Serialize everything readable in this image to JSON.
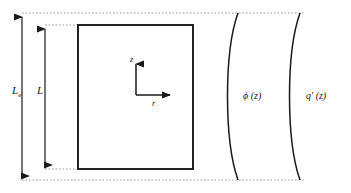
{
  "figure": {
    "type": "engineering-schematic",
    "background_color": "#ffffff",
    "line_color": "#1a1a1a",
    "guide_color": "#8a8a8a"
  },
  "dimensions": {
    "extrapolated": {
      "label": "L",
      "subscript": "e",
      "name": "extrapolated-length"
    },
    "active": {
      "label": "L",
      "subscript": "",
      "name": "active-length"
    }
  },
  "axes": {
    "vertical": {
      "label": "z",
      "direction": "up"
    },
    "horizontal": {
      "label": "r",
      "direction": "right"
    }
  },
  "curves": [
    {
      "name": "flux-curve",
      "label": "ϕ (z)",
      "description": "neutron-flux-profile"
    },
    {
      "name": "heat-rate-curve",
      "label": "q' (z)",
      "description": "linear-heat-rate-profile"
    }
  ],
  "shapes": {
    "core_rectangle": {
      "name": "fuel-core-rectangle"
    }
  }
}
